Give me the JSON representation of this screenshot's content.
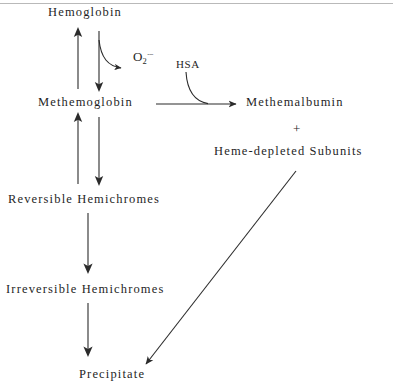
{
  "diagram": {
    "type": "flow-diagram",
    "background_color": "#ffffff",
    "stroke_color": "#2b2b2b",
    "text_color": "#1f1f1f",
    "nodes": [
      {
        "id": "hemoglobin",
        "label": "Hemoglobin",
        "x": 48,
        "y": 6
      },
      {
        "id": "superoxide",
        "label": "O2·−",
        "base": "O",
        "sub": "2",
        "sup": "·−",
        "x": 133,
        "y": 50
      },
      {
        "id": "hsa",
        "label": "HSA",
        "x": 176,
        "y": 58
      },
      {
        "id": "methemoglobin",
        "label": "Methemoglobin",
        "x": 38,
        "y": 96
      },
      {
        "id": "methemalbumin",
        "label": "Methemalbumin",
        "x": 246,
        "y": 96
      },
      {
        "id": "plus",
        "label": "+",
        "x": 293,
        "y": 122
      },
      {
        "id": "heme-depleted-subunits",
        "label": "Heme-depleted  Subunits",
        "x": 214,
        "y": 145
      },
      {
        "id": "reversible-hemichromes",
        "label": "Reversible  Hemichromes",
        "x": 8,
        "y": 193
      },
      {
        "id": "irreversible-hemichromes",
        "label": "Irreversible  Hemichromes",
        "x": 6,
        "y": 283
      },
      {
        "id": "precipitate",
        "label": "Precipitate",
        "x": 79,
        "y": 368
      }
    ],
    "edges": [
      {
        "id": "methemoglobin-to-hemoglobin",
        "from": "methemoglobin",
        "to": "hemoglobin",
        "direction": "up"
      },
      {
        "id": "hemoglobin-to-methemoglobin",
        "from": "hemoglobin",
        "to": "methemoglobin",
        "direction": "down"
      },
      {
        "id": "hemoglobin-to-superoxide",
        "from": "hemoglobin",
        "to": "superoxide",
        "direction": "curved-right"
      },
      {
        "id": "methemoglobin-to-methemalbumin",
        "from": "methemoglobin",
        "to": "methemalbumin",
        "direction": "right",
        "cofactor": "HSA"
      },
      {
        "id": "reversible-to-methemoglobin",
        "from": "reversible-hemichromes",
        "to": "methemoglobin",
        "direction": "up"
      },
      {
        "id": "methemoglobin-to-reversible",
        "from": "methemoglobin",
        "to": "reversible-hemichromes",
        "direction": "down"
      },
      {
        "id": "reversible-to-irreversible",
        "from": "reversible-hemichromes",
        "to": "irreversible-hemichromes",
        "direction": "down"
      },
      {
        "id": "irreversible-to-precipitate",
        "from": "irreversible-hemichromes",
        "to": "precipitate",
        "direction": "down"
      },
      {
        "id": "heme-depleted-to-precipitate",
        "from": "heme-depleted-subunits",
        "to": "precipitate",
        "direction": "diagonal-down-left"
      }
    ]
  }
}
